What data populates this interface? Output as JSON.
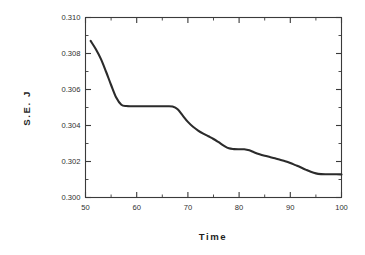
{
  "chart_data": {
    "type": "line",
    "title": "",
    "xlabel": "Time",
    "ylabel": "S.E. J",
    "xlim": [
      50,
      100
    ],
    "ylim": [
      0.3,
      0.31
    ],
    "grid": false,
    "legend": null,
    "x_ticks": [
      50,
      60,
      70,
      80,
      90,
      100
    ],
    "x_tick_labels": [
      "50",
      "60",
      "70",
      "80",
      "90",
      "100"
    ],
    "x_minor_ticks": [
      55,
      65,
      75,
      85,
      95
    ],
    "y_ticks": [
      0.3,
      0.302,
      0.304,
      0.306,
      0.308,
      0.31
    ],
    "y_tick_labels": [
      "0.300",
      "0.302",
      "0.304",
      "0.306",
      "0.308",
      "0.310"
    ],
    "y_minor_ticks": [
      0.301,
      0.303,
      0.305,
      0.307,
      0.309
    ],
    "series": [
      {
        "name": "S.E. J",
        "color": "#2b2b2b",
        "x": [
          51.0,
          52.0,
          53.0,
          54.0,
          55.0,
          56.0,
          57.0,
          58.0,
          59.0,
          60.0,
          61.0,
          62.0,
          63.0,
          64.0,
          65.0,
          66.0,
          67.0,
          68.0,
          69.0,
          70.0,
          71.0,
          72.0,
          73.0,
          74.0,
          75.0,
          76.0,
          77.0,
          78.0,
          79.0,
          80.0,
          81.0,
          82.0,
          83.0,
          84.0,
          85.0,
          86.0,
          87.0,
          88.0,
          89.0,
          90.0,
          91.0,
          92.0,
          93.0,
          94.0,
          95.0,
          96.0,
          97.0,
          98.0,
          99.0,
          100.0
        ],
        "y": [
          0.3087,
          0.30825,
          0.3077,
          0.307,
          0.30625,
          0.30555,
          0.30515,
          0.30508,
          0.30507,
          0.30507,
          0.30507,
          0.30507,
          0.30507,
          0.30507,
          0.30507,
          0.30507,
          0.30505,
          0.3049,
          0.30455,
          0.3042,
          0.30393,
          0.30372,
          0.30355,
          0.3034,
          0.30325,
          0.30307,
          0.30288,
          0.30273,
          0.30269,
          0.30268,
          0.30268,
          0.30262,
          0.3025,
          0.3024,
          0.30232,
          0.30225,
          0.30218,
          0.3021,
          0.30202,
          0.30192,
          0.3018,
          0.30168,
          0.30155,
          0.30143,
          0.30134,
          0.3013,
          0.30129,
          0.30129,
          0.30129,
          0.30128
        ]
      }
    ]
  }
}
